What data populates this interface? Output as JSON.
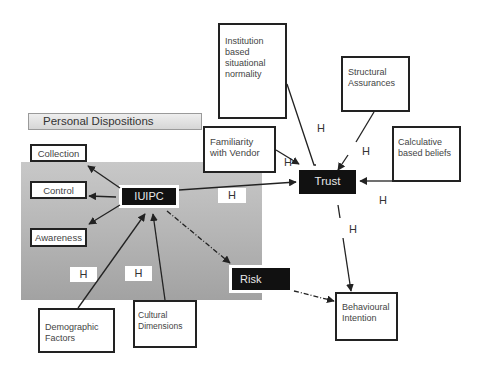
{
  "diagram": {
    "group": {
      "label": "Personal Dispositions"
    },
    "nodes": {
      "collection": "Collection",
      "control": "Control",
      "awareness": "Awareness",
      "iuipc": "IUIPC",
      "institution": "Institution based situational normality",
      "familiarity": "Familiarity with Vendor",
      "structural": "Structural Assurances",
      "calculative": "Calculative based beliefs",
      "trust": "Trust",
      "risk": "Risk",
      "behavioural": "Behavioural Intention",
      "demographic": "Demographic Factors",
      "cultural": "Cultural Dimensions"
    },
    "hypothesis_labels": [
      "H",
      "H",
      "H",
      "H",
      "H",
      "H",
      "H",
      "H"
    ],
    "edges": [
      {
        "from": "IUIPC",
        "to": "Collection",
        "style": "solid"
      },
      {
        "from": "IUIPC",
        "to": "Control",
        "style": "solid"
      },
      {
        "from": "IUIPC",
        "to": "Awareness",
        "style": "solid"
      },
      {
        "from": "IUIPC",
        "to": "Trust",
        "style": "solid"
      },
      {
        "from": "IUIPC",
        "to": "Risk",
        "style": "dash-dot"
      },
      {
        "from": "Demographic Factors",
        "to": "IUIPC",
        "style": "solid"
      },
      {
        "from": "Cultural Dimensions",
        "to": "IUIPC",
        "style": "solid"
      },
      {
        "from": "Familiarity with Vendor",
        "to": "Trust",
        "style": "solid"
      },
      {
        "from": "Institution based situational normality",
        "to": "Trust",
        "style": "solid"
      },
      {
        "from": "Structural Assurances",
        "to": "Trust",
        "style": "solid"
      },
      {
        "from": "Calculative based beliefs",
        "to": "Trust",
        "style": "solid"
      },
      {
        "from": "Trust",
        "to": "Behavioural Intention",
        "style": "solid"
      },
      {
        "from": "Risk",
        "to": "Behavioural Intention",
        "style": "dash-dot"
      }
    ]
  }
}
